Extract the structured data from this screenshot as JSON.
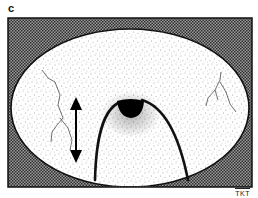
{
  "figure": {
    "panel_label": "c",
    "signature": "TKT",
    "colors": {
      "frame_hatch_dark": "#3a3a3a",
      "frame_hatch_light": "#9a9a9a",
      "ellipse_fill": "#ffffff",
      "stipple": "#555555",
      "outline": "#111111",
      "blob": "#000000"
    },
    "elements": [
      "hatched-frame",
      "stippled-ellipse",
      "arch-curve",
      "black-semicircle",
      "double-headed-arrow",
      "crack-lines"
    ]
  }
}
